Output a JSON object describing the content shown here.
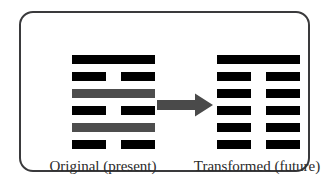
{
  "figure": {
    "type": "hexagram-transformation-diagram",
    "background_color": "#ffffff",
    "frame": {
      "border_color": "#3a3a3c",
      "corner_radius_px": 14
    }
  },
  "colors": {
    "solid_line": "#000000",
    "changing_line": "#4d4d4d",
    "arrow": "#4a4a4a",
    "text": "#2b2b2b"
  },
  "left": {
    "caption": "Original (present)",
    "name": "original-hexagram",
    "lines_top_to_bottom": [
      {
        "position": 6,
        "type": "yang",
        "shape": "solid",
        "changing": false,
        "color": "#000000"
      },
      {
        "position": 5,
        "type": "yin",
        "shape": "broken",
        "changing": false,
        "color": "#000000"
      },
      {
        "position": 4,
        "type": "yang",
        "shape": "solid",
        "changing": true,
        "color": "#4d4d4d"
      },
      {
        "position": 3,
        "type": "yin",
        "shape": "broken",
        "changing": false,
        "color": "#000000"
      },
      {
        "position": 2,
        "type": "yang",
        "shape": "solid",
        "changing": true,
        "color": "#4d4d4d"
      },
      {
        "position": 1,
        "type": "yin",
        "shape": "broken",
        "changing": false,
        "color": "#000000"
      }
    ]
  },
  "right": {
    "caption": "Transformed (future)",
    "name": "transformed-hexagram",
    "lines_top_to_bottom": [
      {
        "position": 6,
        "type": "yang",
        "shape": "solid",
        "changing": false,
        "color": "#000000"
      },
      {
        "position": 5,
        "type": "yin",
        "shape": "broken",
        "changing": false,
        "color": "#000000"
      },
      {
        "position": 4,
        "type": "yin",
        "shape": "broken",
        "changing": false,
        "color": "#000000"
      },
      {
        "position": 3,
        "type": "yin",
        "shape": "broken",
        "changing": false,
        "color": "#000000"
      },
      {
        "position": 2,
        "type": "yin",
        "shape": "broken",
        "changing": false,
        "color": "#000000"
      },
      {
        "position": 1,
        "type": "yin",
        "shape": "broken",
        "changing": false,
        "color": "#000000"
      }
    ]
  },
  "arrow": {
    "name": "transformation-arrow",
    "direction": "right",
    "color": "#4a4a4a"
  }
}
